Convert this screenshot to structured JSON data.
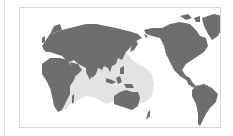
{
  "map": {
    "title": "",
    "projection": "pacific-centred-world",
    "legend": [],
    "colors": {
      "background": "#ffffff",
      "land": "#6e6e6e",
      "range": "#e3e3e3",
      "frame": "#d6d6d6"
    },
    "regions": [
      {
        "name": "europe-asia",
        "type": "land"
      },
      {
        "name": "africa",
        "type": "land"
      },
      {
        "name": "australia",
        "type": "land"
      },
      {
        "name": "north-america",
        "type": "land"
      },
      {
        "name": "south-america",
        "type": "land"
      },
      {
        "name": "greenland",
        "type": "land"
      },
      {
        "name": "indo-pacific-range",
        "type": "distribution-range",
        "extent": "East Africa coast through Indian Ocean, Southeast Asia, northern Australia to western-central Pacific"
      }
    ]
  }
}
